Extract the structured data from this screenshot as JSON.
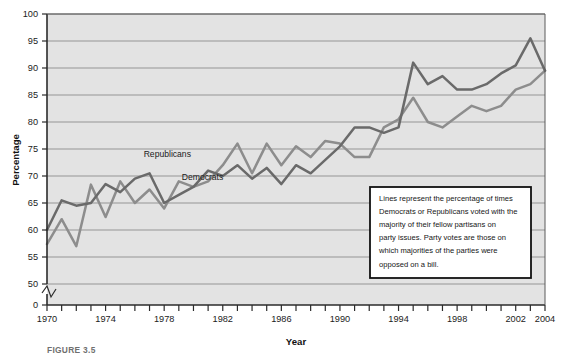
{
  "figure": {
    "caption": "FIGURE 3.5",
    "note": {
      "lines": [
        "Lines represent the percentage of times",
        "Democrats or Republicans voted with the",
        "majority of their fellow partisans on",
        "party issues. Party votes are those on",
        "which majorities of the parties were",
        "opposed on a bill."
      ]
    }
  },
  "colors": {
    "plot_background": "#e3e3e3",
    "gridline": "#8c8c8c",
    "axis": "#2b2b2b",
    "democrats_line": "#8d8d8d",
    "republicans_line": "#6a6a6a",
    "note_border": "#111111",
    "note_background": "#ffffff",
    "caption": "#6f6f6f"
  },
  "chart_data": {
    "type": "line",
    "title": "",
    "xlabel": "Year",
    "ylabel": "Percentage",
    "xlim": [
      1970,
      2004
    ],
    "ylim": [
      50,
      100
    ],
    "y_axis_break": true,
    "y_axis_zero_label": "0",
    "grid": true,
    "legend": "inline-labels",
    "ytick_labels": [
      "0",
      "50",
      "55",
      "60",
      "65",
      "70",
      "75",
      "80",
      "85",
      "90",
      "95",
      "100"
    ],
    "yticks": [
      50,
      55,
      60,
      65,
      70,
      75,
      80,
      85,
      90,
      95,
      100
    ],
    "xticks": [
      1970,
      1971,
      1972,
      1973,
      1974,
      1975,
      1976,
      1977,
      1978,
      1979,
      1980,
      1981,
      1982,
      1983,
      1984,
      1985,
      1986,
      1987,
      1988,
      1989,
      1990,
      1991,
      1992,
      1993,
      1994,
      1995,
      1996,
      1997,
      1998,
      1999,
      2000,
      2001,
      2002,
      2003,
      2004
    ],
    "xtick_labels": [
      {
        "year": 1970,
        "label": "1970"
      },
      {
        "year": 1974,
        "label": "1974"
      },
      {
        "year": 1978,
        "label": "1978"
      },
      {
        "year": 1982,
        "label": "1982"
      },
      {
        "year": 1986,
        "label": "1986"
      },
      {
        "year": 1990,
        "label": "1990"
      },
      {
        "year": 1994,
        "label": "1994"
      },
      {
        "year": 1998,
        "label": "1998"
      },
      {
        "year": 2002,
        "label": "2002"
      },
      {
        "year": 2004,
        "label": "2004"
      }
    ],
    "x": [
      1970,
      1971,
      1972,
      1973,
      1974,
      1975,
      1976,
      1977,
      1978,
      1979,
      1980,
      1981,
      1982,
      1983,
      1984,
      1985,
      1986,
      1987,
      1988,
      1989,
      1990,
      1991,
      1992,
      1993,
      1994,
      1995,
      1996,
      1997,
      1998,
      1999,
      2000,
      2001,
      2002,
      2003,
      2004
    ],
    "series": [
      {
        "name": "Democrats",
        "label": "Democrats",
        "color": "#8d8d8d",
        "label_position": {
          "year": 1979.2,
          "value": 69.2
        },
        "values": [
          57.4,
          62.0,
          57.0,
          68.4,
          62.4,
          69.0,
          65.0,
          67.5,
          64.0,
          69.0,
          68.0,
          69.0,
          72.0,
          76.0,
          70.5,
          76.0,
          72.0,
          75.5,
          73.5,
          76.5,
          76.0,
          73.5,
          73.5,
          79.0,
          80.5,
          84.5,
          80.0,
          79.0,
          81.0,
          83.0,
          82.0,
          83.0,
          86.0,
          87.0,
          89.5
        ]
      },
      {
        "name": "Republicans",
        "label": "Republicans",
        "color": "#6a6a6a",
        "label_position": {
          "year": 1976.6,
          "value": 73.6
        },
        "values": [
          60.0,
          65.5,
          64.5,
          65.0,
          68.5,
          67.0,
          69.5,
          70.5,
          65.0,
          66.5,
          68.0,
          71.0,
          70.0,
          72.0,
          69.5,
          71.5,
          68.5,
          72.0,
          70.5,
          73.0,
          75.5,
          79.0,
          79.0,
          78.0,
          79.0,
          91.0,
          87.0,
          88.5,
          86.0,
          86.0,
          87.0,
          89.0,
          90.5,
          95.5,
          89.5
        ]
      }
    ]
  }
}
